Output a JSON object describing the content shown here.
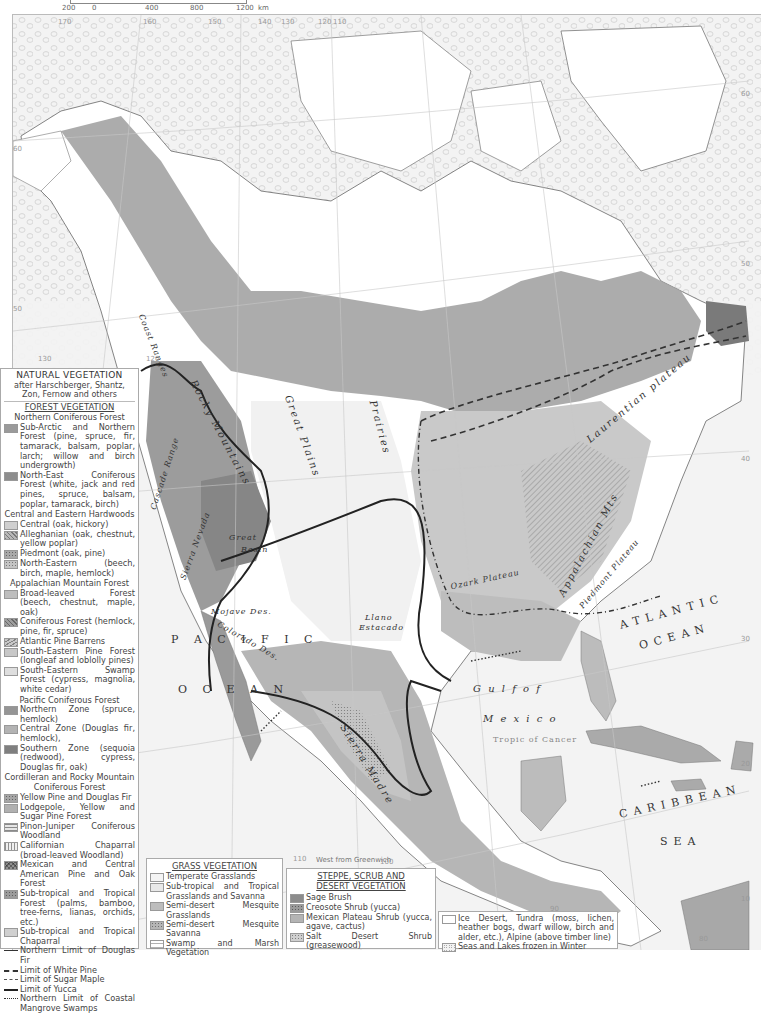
{
  "scale": {
    "ticks": [
      "200",
      "0",
      "400",
      "800",
      "1200"
    ],
    "unit": "km"
  },
  "map": {
    "ocean_labels": {
      "pacific": "P A C I F I C",
      "pacific_ocean": "O C E A N",
      "atlantic": "ATLANTIC",
      "atlantic_ocean": "OCEAN",
      "gulf_of": "G u l f    o f",
      "mexico": "M e x i c o",
      "caribbean": "CARIBBEAN",
      "sea": "SEA"
    },
    "feature_labels": {
      "rocky_mountains": "Rocky Mountains",
      "great_plains": "Great Plains",
      "prairies": "Prairies",
      "coast_ranges": "Coast Ranges",
      "cascade_range": "Cascade Range",
      "sierra_nevada": "Sierra Nevada",
      "great_basin_1": "Great",
      "great_basin_2": "Basin",
      "mojave_desert": "Mojave Des.",
      "colorado_des": "Colorado Des.",
      "llano_1": "Llano",
      "llano_2": "Estacado",
      "ozark_plateau": "Ozark Plateau",
      "appalachian_mts": "Appalachian Mts",
      "piedmont_plateau": "Piedmont Plateau",
      "laurentian_plateau": "Laurentian plateau",
      "sierra_madre": "Sierra Madre",
      "tropic_of_cancer": "Tropic of Cancer"
    },
    "graticule_labels": {
      "lon_top": [
        "170",
        "160",
        "150",
        "140",
        "130",
        "120",
        "110"
      ],
      "lat_right": [
        "60",
        "50",
        "40",
        "30",
        "20",
        "10"
      ],
      "lat_left": [
        "60",
        "50"
      ],
      "lon_left_bottom": [
        "130",
        "120"
      ],
      "lon_bottom": [
        "110",
        "100",
        "90",
        "80"
      ]
    },
    "west_from_greenwich": "West from Greenwich"
  },
  "legend": {
    "title": "NATURAL VEGETATION",
    "subtitle": "after Harschberger, Shantz, Zon, Fernow and others",
    "forest": {
      "heading": "FOREST VEGETATION",
      "groups": [
        {
          "title": "Northern Coniferous Forest",
          "items": [
            {
              "label": "Sub-Arctic and Northern Forest (pine, spruce, fir, tamarack, balsam, poplar, larch; willow and birch undergrowth)",
              "color": "#9a9a9a"
            },
            {
              "label": "North-East Coniferous Forest (white, jack and red pines, spruce, balsam, poplar, tamarack, birch)",
              "color": "#8d8d8d"
            }
          ]
        },
        {
          "title": "Central and Eastern Hardwoods",
          "items": [
            {
              "label": "Central (oak, hickory)",
              "color": "#cfcfcf"
            },
            {
              "label": "Alleghanian (oak, chestnut, yellow poplar)",
              "color": "#b8b8b8",
              "pattern": "hatch"
            },
            {
              "label": "Piedmont (oak, pine)",
              "color": "#a9a9a9",
              "pattern": "dots"
            },
            {
              "label": "North-Eastern (beech, birch, maple, hemlock)",
              "color": "#c4c4c4",
              "pattern": "dots"
            }
          ]
        },
        {
          "title": "Appalachian Mountain Forest",
          "items": [
            {
              "label": "Broad-leaved Forest (beech, chestnut, maple, oak)",
              "color": "#bdbdbd"
            },
            {
              "label": "Coniferous Forest (hemlock, pine, fir, spruce)",
              "color": "#9e9e9e",
              "pattern": "hatch"
            },
            {
              "label": "Atlantic Pine Barrens",
              "color": "#c8c8c8",
              "pattern": "wave"
            },
            {
              "label": "South-Eastern Pine Forest (longleaf and loblolly pines)",
              "color": "#c7c7c7"
            },
            {
              "label": "South-Eastern Swamp Forest (cypress, magnolia, white cedar)",
              "color": "#dedede"
            }
          ]
        },
        {
          "title": "Pacific Coniferous Forest",
          "items": [
            {
              "label": "Northern Zone (spruce, hemlock)",
              "color": "#959595"
            },
            {
              "label": "Central Zone (Douglas fir, hemlock),",
              "color": "#b3b3b3"
            },
            {
              "label": "Southern Zone (sequoia (redwood), cypress, Douglas fir, oak)",
              "color": "#7f7f7f"
            }
          ]
        },
        {
          "title": "Cordilleran and Rocky Mountain Coniferous Forest",
          "items": [
            {
              "label": "Yellow Pine and Douglas Fir",
              "color": "#a5a5a5",
              "pattern": "dots"
            },
            {
              "label": "Lodgepole, Yellow and Sugar Pine Forest",
              "color": "#b0b0b0"
            },
            {
              "label": "Pinon-Juniper Coniferous Woodland",
              "color": "#e6e6e6",
              "pattern": "hlines"
            },
            {
              "label": "Californian Chaparral (broad-leaved Woodland)",
              "color": "#f0f0f0",
              "pattern": "vlines"
            },
            {
              "label": "Mexican and Central American Pine and Oak Forest",
              "color": "#8f8f8f",
              "pattern": "cross"
            },
            {
              "label": "Sub-tropical and Tropical Forest (palms, bamboo, tree-ferns, lianas, orchids, etc.)",
              "color": "#9c9c9c",
              "pattern": "dots"
            },
            {
              "label": "Sub-tropical and Tropical Chaparral",
              "color": "#d0d0d0"
            }
          ]
        }
      ],
      "lines": [
        {
          "label": "Northern Limit of Douglas Fir",
          "style": "solid-thin"
        },
        {
          "label": "Limit of White Pine",
          "style": "dashed"
        },
        {
          "label": "Limit of Sugar Maple",
          "style": "dash-dot"
        },
        {
          "label": "Limit of Yucca",
          "style": "solid-thick"
        },
        {
          "label": "Northern Limit of Coastal Mangrove Swamps",
          "style": "dotted"
        }
      ]
    },
    "grass": {
      "heading": "GRASS VEGETATION",
      "items": [
        {
          "label": "Temperate Grasslands",
          "color": "#f4f4f4"
        },
        {
          "label": "Sub-tropical and Tropical Grasslands and Savanna",
          "color": "#e8e8e8"
        },
        {
          "label": "Semi-desert Mesquite Grasslands",
          "color": "#bdbdbd"
        },
        {
          "label": "Semi-desert Mesquite Savanna",
          "color": "#b5b5b5",
          "pattern": "dots"
        },
        {
          "label": "Swamp and Marsh Vegetation",
          "color": "#ffffff",
          "pattern": "marsh"
        }
      ]
    },
    "steppe": {
      "heading_1": "STEPPE, SCRUB AND",
      "heading_2": "DESERT VEGETATION",
      "items": [
        {
          "label": "Sage Brush",
          "color": "#8c8c8c"
        },
        {
          "label": "Creosote Shrub (yucca)",
          "color": "#9a9a9a",
          "pattern": "dots"
        },
        {
          "label": "Mexican Plateau Shrub (yucca, agave, cactus)",
          "color": "#b4b4b4"
        },
        {
          "label": "Salt Desert Shrub (greasewood)",
          "color": "#cfcfcf",
          "pattern": "dots"
        }
      ]
    },
    "ice": {
      "items": [
        {
          "label": "Ice Desert, Tundra (moss, lichen, heather bogs, dwarf willow, birch and alder, etc.), Alpine (above timber line)",
          "color": "#ffffff"
        },
        {
          "label": "Seas and Lakes frozen in Winter",
          "color": "#f2f2f2",
          "pattern": "rings"
        }
      ]
    }
  }
}
